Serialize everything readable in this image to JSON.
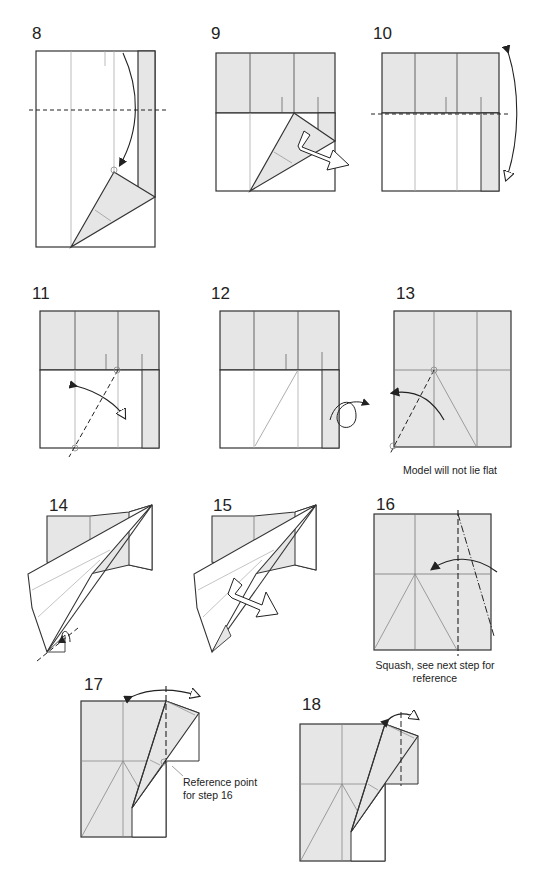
{
  "colors": {
    "paper_white": "#ffffff",
    "paper_gray": "#e6e6e6",
    "line": "#333333",
    "crease": "#9a9a9a"
  },
  "steps": [
    {
      "number": "8"
    },
    {
      "number": "9"
    },
    {
      "number": "10"
    },
    {
      "number": "11"
    },
    {
      "number": "12"
    },
    {
      "number": "13",
      "caption": "Model will not lie flat"
    },
    {
      "number": "14"
    },
    {
      "number": "15"
    },
    {
      "number": "16",
      "caption_line1": "Squash, see next step for",
      "caption_line2": "reference"
    },
    {
      "number": "17",
      "annotation_line1": "Reference point",
      "annotation_line2": "for step 16"
    },
    {
      "number": "18"
    }
  ]
}
